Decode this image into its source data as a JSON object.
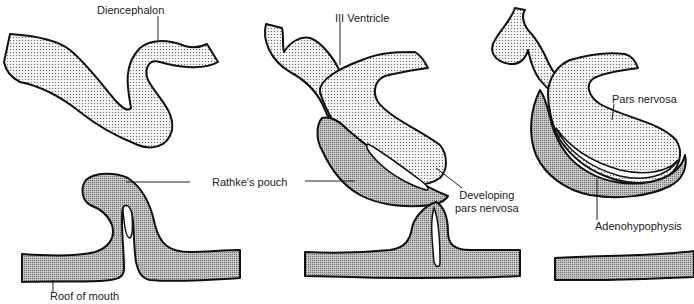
{
  "figure": {
    "stages": [
      {
        "id": "stage-1",
        "labels": {
          "diencephalon": "Diencephalon",
          "rathkes_pouch": "Rathke's pouch",
          "roof_of_mouth": "Roof of mouth"
        }
      },
      {
        "id": "stage-2",
        "labels": {
          "third_ventricle": "III Ventricle",
          "developing_pars_nervosa_line1": "Developing",
          "developing_pars_nervosa_line2": "pars nervosa"
        }
      },
      {
        "id": "stage-3",
        "labels": {
          "pars_nervosa": "Pars nervosa",
          "adenohypophysis": "Adenohypophysis"
        }
      }
    ],
    "legend": {
      "neural_tissue_pattern": "fine dots",
      "oral_ectoderm_pattern": "dense crosshatch"
    },
    "colors": {
      "outline": "#111111",
      "neural_fill": "#f2f2f2",
      "oral_fill": "#b8b8b8",
      "background": "#ffffff"
    }
  }
}
